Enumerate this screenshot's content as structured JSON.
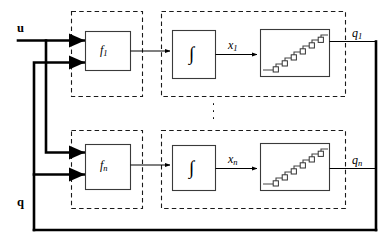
{
  "diagram": {
    "type": "control-block-diagram",
    "colors": {
      "line": "#000000",
      "box_stroke": "#3a3a3a",
      "dashed_stroke": "#1a1a1a",
      "background": "#ffffff"
    },
    "inputs": [
      {
        "name": "u",
        "label": "u",
        "style": "bold-vector"
      },
      {
        "name": "q",
        "label": "q",
        "style": "bold-vector"
      }
    ],
    "outputs": [
      {
        "name": "q1",
        "base": "q",
        "subscript": "1"
      },
      {
        "name": "qn",
        "base": "q",
        "subscript": "n"
      }
    ],
    "channels": [
      {
        "id": "channel-1",
        "function_block": {
          "base": "f",
          "subscript": "1"
        },
        "integrator_block": {
          "glyph": "∫",
          "name": "integrator"
        },
        "state_signal": {
          "base": "x",
          "subscript": "1"
        },
        "quantizer_block": {
          "name": "quantizer",
          "shape": "staircase",
          "steps": 6
        },
        "output_signal": {
          "base": "q",
          "subscript": "1"
        }
      },
      {
        "id": "channel-n",
        "function_block": {
          "base": "f",
          "subscript": "n"
        },
        "integrator_block": {
          "glyph": "∫",
          "name": "integrator"
        },
        "state_signal": {
          "base": "x",
          "subscript": "n"
        },
        "quantizer_block": {
          "name": "quantizer",
          "shape": "staircase",
          "steps": 6
        },
        "output_signal": {
          "base": "q",
          "subscript": "n"
        }
      }
    ],
    "ellipsis": {
      "glyph": "⋮",
      "label": "vertical-ellipsis",
      "count": 3
    }
  }
}
